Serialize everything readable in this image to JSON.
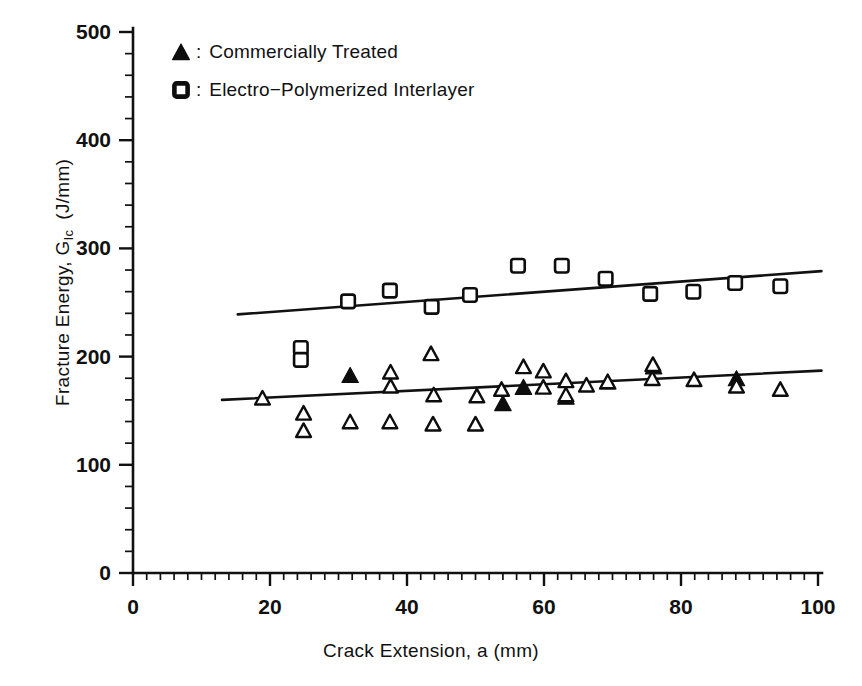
{
  "figure": {
    "background": "#ffffff",
    "ink_color": "#0d0d0d"
  },
  "legend": {
    "position": "top-left-inside",
    "entries": [
      {
        "symbol": "filled-triangle",
        "separator": ":",
        "label": "Commercially Treated"
      },
      {
        "symbol": "open-square",
        "separator": ":",
        "label": "Electro−Polymerized Interlayer"
      }
    ]
  },
  "axes": {
    "x": {
      "label": "Crack Extension, a (mm)",
      "ticks": [
        0,
        20,
        40,
        60,
        80,
        100
      ],
      "tick_labels": [
        "0",
        "20",
        "40",
        "60",
        "80",
        "100"
      ],
      "range": [
        0,
        100
      ],
      "minor_tick_step": 2
    },
    "y": {
      "label_prefix": "Fracture Energy, G",
      "label_subscript": "Ic",
      "label_units": "(J/mm)",
      "label_full": "Fracture Energy, G Ic  (J/mm)",
      "ticks": [
        0,
        100,
        200,
        300,
        400,
        500
      ],
      "tick_labels": [
        "0",
        "100",
        "200",
        "300",
        "400",
        "500"
      ],
      "range": [
        0,
        500
      ],
      "minor_tick_step": 20
    }
  },
  "chart_data": {
    "type": "scatter",
    "title": "",
    "xlabel": "Crack Extension, a (mm)",
    "ylabel": "Fracture Energy, G_Ic (J/mm)",
    "xlim": [
      0,
      100
    ],
    "ylim": [
      0,
      500
    ],
    "grid": false,
    "legend_position": "upper left",
    "series": [
      {
        "name": "Electro−Polymerized Interlayer",
        "marker": "open-square",
        "points": [
          {
            "x": 24.5,
            "y": 208
          },
          {
            "x": 24.5,
            "y": 197
          },
          {
            "x": 31.4,
            "y": 251
          },
          {
            "x": 37.5,
            "y": 261
          },
          {
            "x": 43.6,
            "y": 246
          },
          {
            "x": 49.2,
            "y": 257
          },
          {
            "x": 56.2,
            "y": 284
          },
          {
            "x": 62.6,
            "y": 284
          },
          {
            "x": 69.0,
            "y": 272
          },
          {
            "x": 75.5,
            "y": 258
          },
          {
            "x": 81.8,
            "y": 260
          },
          {
            "x": 87.9,
            "y": 268
          },
          {
            "x": 94.5,
            "y": 265
          }
        ],
        "trend_line": {
          "x_start": 15.3,
          "y_start": 239,
          "x_end": 100.5,
          "y_end": 279
        }
      },
      {
        "name": "Commercially Treated",
        "marker": "filled-triangle",
        "points": [
          {
            "x": 31.7,
            "y": 183
          },
          {
            "x": 54.0,
            "y": 157
          },
          {
            "x": 57.0,
            "y": 172
          },
          {
            "x": 63.2,
            "y": 163
          },
          {
            "x": 69.3,
            "y": 177
          },
          {
            "x": 76.0,
            "y": 191
          },
          {
            "x": 88.1,
            "y": 180
          }
        ],
        "trend_line": {
          "x_start": 13.0,
          "y_start": 160,
          "x_end": 100.5,
          "y_end": 187
        }
      },
      {
        "name": "Commercially Treated (open)",
        "marker": "open-triangle",
        "points": [
          {
            "x": 18.9,
            "y": 162
          },
          {
            "x": 24.9,
            "y": 148
          },
          {
            "x": 24.9,
            "y": 132
          },
          {
            "x": 31.7,
            "y": 140
          },
          {
            "x": 37.6,
            "y": 186
          },
          {
            "x": 37.6,
            "y": 173
          },
          {
            "x": 37.5,
            "y": 140
          },
          {
            "x": 43.5,
            "y": 203
          },
          {
            "x": 43.9,
            "y": 165
          },
          {
            "x": 43.8,
            "y": 138
          },
          {
            "x": 50.2,
            "y": 164
          },
          {
            "x": 50.0,
            "y": 138
          },
          {
            "x": 53.8,
            "y": 170
          },
          {
            "x": 57.0,
            "y": 191
          },
          {
            "x": 59.9,
            "y": 187
          },
          {
            "x": 59.9,
            "y": 172
          },
          {
            "x": 63.2,
            "y": 178
          },
          {
            "x": 63.2,
            "y": 165
          },
          {
            "x": 66.2,
            "y": 174
          },
          {
            "x": 69.3,
            "y": 177
          },
          {
            "x": 75.9,
            "y": 193
          },
          {
            "x": 75.8,
            "y": 180
          },
          {
            "x": 81.9,
            "y": 179
          },
          {
            "x": 88.1,
            "y": 173
          },
          {
            "x": 94.5,
            "y": 170
          }
        ]
      }
    ]
  }
}
